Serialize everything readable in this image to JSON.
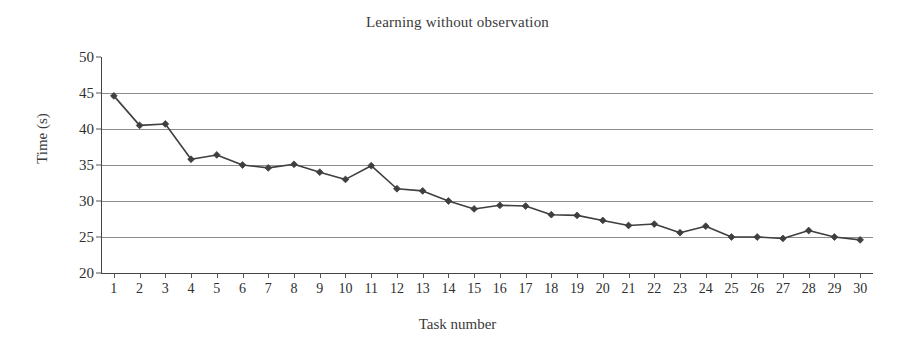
{
  "chart_data": {
    "type": "line",
    "title": "Learning without observation",
    "xlabel": "Task number",
    "ylabel": "Time (s)",
    "x": [
      1,
      2,
      3,
      4,
      5,
      6,
      7,
      8,
      9,
      10,
      11,
      12,
      13,
      14,
      15,
      16,
      17,
      18,
      19,
      20,
      21,
      22,
      23,
      24,
      25,
      26,
      27,
      28,
      29,
      30
    ],
    "values": [
      44.6,
      40.5,
      40.7,
      35.8,
      36.4,
      35.0,
      34.6,
      35.1,
      34.0,
      33.0,
      34.9,
      31.7,
      31.4,
      30.0,
      28.9,
      29.4,
      29.3,
      28.1,
      28.0,
      27.3,
      26.6,
      26.8,
      25.6,
      26.5,
      25.0,
      25.0,
      24.8,
      25.9,
      25.0,
      24.6
    ],
    "series": [
      {
        "name": "Learning without observation",
        "values": [
          44.6,
          40.5,
          40.7,
          35.8,
          36.4,
          35.0,
          34.6,
          35.1,
          34.0,
          33.0,
          34.9,
          31.7,
          31.4,
          30.0,
          28.9,
          29.4,
          29.3,
          28.1,
          28.0,
          27.3,
          26.6,
          26.8,
          25.6,
          26.5,
          25.0,
          25.0,
          24.8,
          25.9,
          25.0,
          24.6
        ],
        "marker": "diamond",
        "color": "#3f3f3f"
      }
    ],
    "xticklabels": [
      "1",
      "2",
      "3",
      "4",
      "5",
      "6",
      "7",
      "8",
      "9",
      "10",
      "11",
      "12",
      "13",
      "14",
      "15",
      "16",
      "17",
      "18",
      "19",
      "20",
      "21",
      "22",
      "23",
      "24",
      "25",
      "26",
      "27",
      "28",
      "29",
      "30"
    ],
    "yticklabels": [
      "20",
      "25",
      "30",
      "35",
      "40",
      "45",
      "50"
    ],
    "yticks": [
      20,
      25,
      30,
      35,
      40,
      45,
      50
    ],
    "ylim": [
      20,
      50
    ],
    "xlim": [
      0.5,
      30.5
    ],
    "grid": "horizontal",
    "gridlines_at": [
      25,
      30,
      35,
      40,
      45
    ],
    "legend": "none",
    "line_color": "#3f3f3f",
    "grid_color": "#8c8c8c",
    "axis_color": "#444444",
    "background": "#ffffff"
  }
}
